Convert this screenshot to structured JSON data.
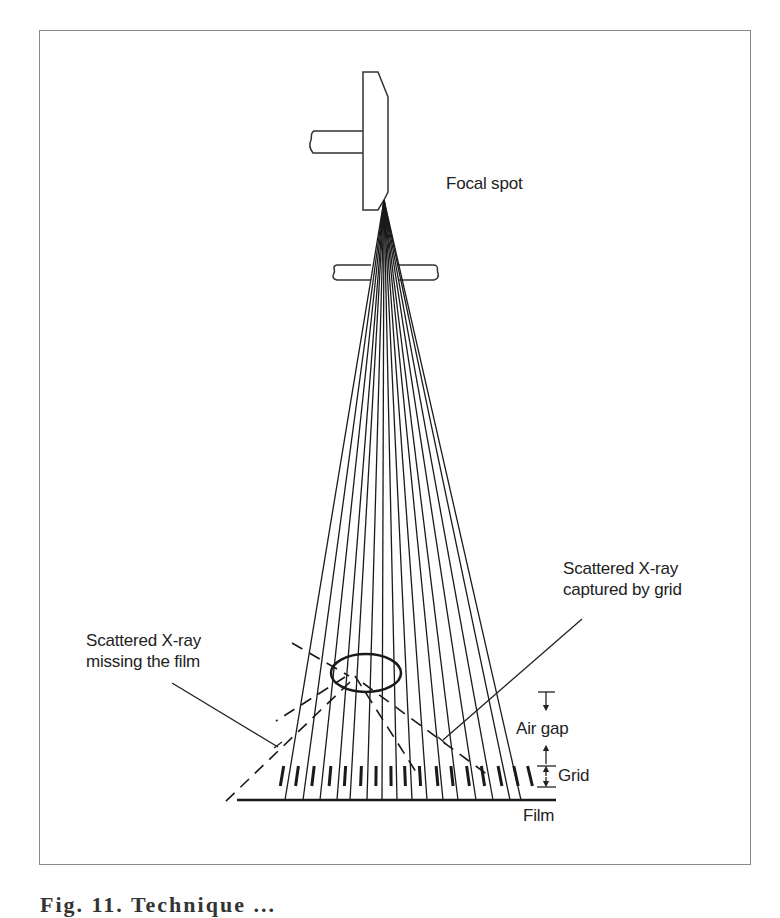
{
  "figure": {
    "labels": {
      "focal_spot": "Focal spot",
      "scatter_captured_line1": "Scattered X-ray",
      "scatter_captured_line2": "captured by grid",
      "scatter_missing_line1": "Scattered X-ray",
      "scatter_missing_line2": "missing the film",
      "air_gap": "Air gap",
      "grid": "Grid",
      "film": "Film"
    },
    "caption": "Fig. 11. Technique ..."
  },
  "geometry": {
    "focal_point": [
      384,
      200
    ],
    "film_y": 800,
    "ray_endpoints_x": [
      285,
      303,
      320,
      337,
      350,
      367,
      382,
      397,
      412,
      427,
      443,
      458,
      476,
      493,
      510,
      521
    ],
    "grid_bar_x": [
      282,
      297,
      313,
      330,
      345,
      361,
      376,
      391,
      405,
      420,
      437,
      452,
      468,
      483,
      500,
      516,
      530
    ],
    "grid_top_y": 766,
    "grid_bottom_y": 786,
    "scatter_ellipse": {
      "cx": 366,
      "cy": 673,
      "rx": 35,
      "ry": 19
    }
  }
}
